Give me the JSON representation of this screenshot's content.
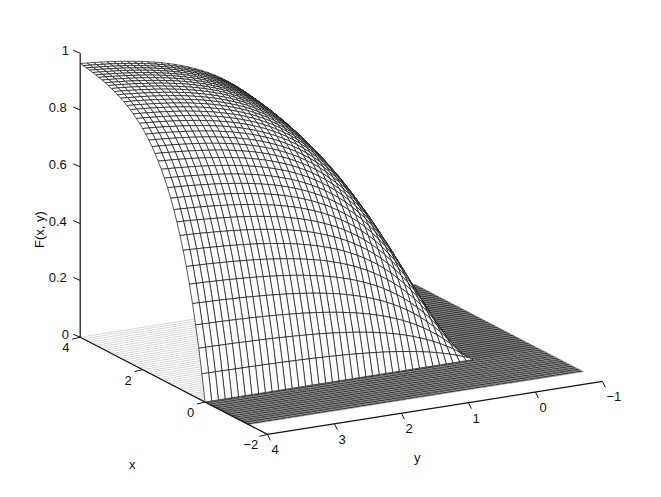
{
  "chart_data": {
    "type": "surface",
    "title": "",
    "xlabel": "x",
    "ylabel": "y",
    "zlabel": "F(x, y)",
    "x_ticks": [
      "4",
      "2",
      "0",
      "−2"
    ],
    "x_tick_values": [
      4,
      2,
      0,
      -2
    ],
    "y_ticks": [
      "4",
      "3",
      "2",
      "1",
      "0",
      "−1"
    ],
    "y_tick_values": [
      4,
      3,
      2,
      1,
      0,
      -1
    ],
    "z_ticks": [
      "0",
      "0.2",
      "0.4",
      "0.6",
      "0.8",
      "1"
    ],
    "z_tick_values": [
      0,
      0.2,
      0.4,
      0.6,
      0.8,
      1
    ],
    "xlim": [
      -2,
      4
    ],
    "ylim": [
      -1,
      4
    ],
    "zlim": [
      0,
      1
    ],
    "grid": false,
    "surface_samples": {
      "note": "approximate F(x,y) read from mesh shape",
      "x": [
        0,
        0.5,
        1,
        2,
        3,
        4
      ],
      "y": [
        0,
        0.5,
        1,
        2,
        3,
        4
      ],
      "z_at_y4": [
        0,
        0.39,
        0.63,
        0.86,
        0.95,
        0.98
      ],
      "z_at_x4": [
        0,
        0.39,
        0.63,
        0.86,
        0.95,
        0.98
      ]
    }
  }
}
